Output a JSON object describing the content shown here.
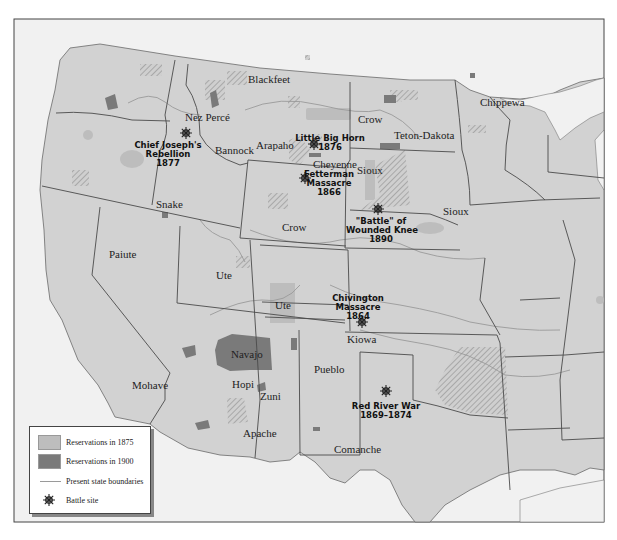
{
  "map": {
    "colors": {
      "land": "#d2d2d2",
      "outside": "#f1f1f1",
      "reservation_1875": "#bdbdbd",
      "reservation_1900": "#7a7a7a",
      "boundary": "#555555",
      "river": "#9a9a9a"
    },
    "tribes": [
      {
        "name": "Blackfeet",
        "x": 248,
        "y": 74
      },
      {
        "name": "Nez Percé",
        "x": 185,
        "y": 112
      },
      {
        "name": "Bannock",
        "x": 215,
        "y": 145
      },
      {
        "name": "Arapaho",
        "x": 256,
        "y": 140
      },
      {
        "name": "Crow",
        "x": 358,
        "y": 114
      },
      {
        "name": "Teton-Dakota",
        "x": 394,
        "y": 130
      },
      {
        "name": "Cheyenne",
        "x": 313,
        "y": 159
      },
      {
        "name": "Sioux",
        "x": 357,
        "y": 165
      },
      {
        "name": "Sioux",
        "x": 443,
        "y": 206
      },
      {
        "name": "Chippewa",
        "x": 480,
        "y": 97
      },
      {
        "name": "Snake",
        "x": 156,
        "y": 199
      },
      {
        "name": "Crow",
        "x": 282,
        "y": 222
      },
      {
        "name": "Paiute",
        "x": 109,
        "y": 249
      },
      {
        "name": "Ute",
        "x": 216,
        "y": 270
      },
      {
        "name": "Ute",
        "x": 275,
        "y": 300
      },
      {
        "name": "Navajo",
        "x": 231,
        "y": 349
      },
      {
        "name": "Hopi",
        "x": 232,
        "y": 379
      },
      {
        "name": "Zuni",
        "x": 260,
        "y": 391
      },
      {
        "name": "Mohave",
        "x": 132,
        "y": 380
      },
      {
        "name": "Apache",
        "x": 243,
        "y": 428
      },
      {
        "name": "Pueblo",
        "x": 314,
        "y": 364
      },
      {
        "name": "Kiowa",
        "x": 347,
        "y": 334
      },
      {
        "name": "Comanche",
        "x": 334,
        "y": 444
      }
    ],
    "battles": [
      {
        "name": "Chief Joseph's\nRebellion\n1877",
        "label_x": 168,
        "label_y": 141,
        "icon_x": 186,
        "icon_y": 133
      },
      {
        "name": "Little Big Horn\n1876",
        "label_x": 330,
        "label_y": 134,
        "icon_x": 314,
        "icon_y": 144
      },
      {
        "name": "Fetterman\nMassacre\n1866",
        "label_x": 329,
        "label_y": 170,
        "icon_x": 305,
        "icon_y": 178
      },
      {
        "name": "\"Battle\" of\nWounded Knee\n1890",
        "label_x": 381,
        "label_y": 217,
        "icon_x": 378,
        "icon_y": 209
      },
      {
        "name": "Chivington\nMassacre\n1864",
        "label_x": 358,
        "label_y": 294,
        "icon_x": 362,
        "icon_y": 322
      },
      {
        "name": "Red River War\n1869–1874",
        "label_x": 386,
        "label_y": 402,
        "icon_x": 386,
        "icon_y": 391
      }
    ],
    "legend": {
      "items": [
        {
          "label": "Reservations in 1875",
          "type": "swatch",
          "color": "#bdbdbd"
        },
        {
          "label": "Reservations in 1900",
          "type": "swatch",
          "color": "#7a7a7a"
        },
        {
          "label": "Present state boundaries",
          "type": "line",
          "color": "#9a9a9a"
        },
        {
          "label": "Battle site",
          "type": "icon",
          "icon": "battle-star-icon"
        }
      ]
    }
  }
}
